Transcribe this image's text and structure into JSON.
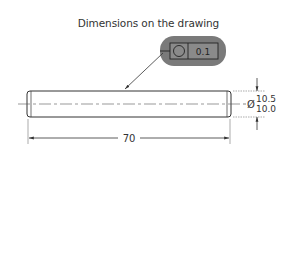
{
  "title": "Dimensions on the drawing",
  "feature_control_frame": {
    "symbol": "circularity",
    "tolerance": "0.1",
    "highlight_color": "#7a7a7a"
  },
  "diameter": {
    "symbol": "Ø",
    "upper": "10.5",
    "lower": "10.0"
  },
  "length": {
    "value": "70"
  },
  "colors": {
    "line": "#333333",
    "background": "#ffffff"
  }
}
